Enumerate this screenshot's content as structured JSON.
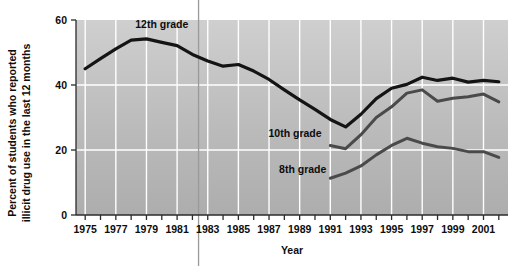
{
  "chart_data": {
    "type": "line",
    "title": "",
    "xlabel": "Year",
    "ylabel": "Percent of students who reported illicit drug use in the last 12 months",
    "ylabel_lines": [
      "Percent of students who reported",
      "illicit drug use in the last 12 months"
    ],
    "xlim": [
      1974.4,
      2002.6
    ],
    "ylim": [
      0,
      60
    ],
    "yticks": [
      0,
      20,
      40,
      60
    ],
    "ytick_labels": [
      "0",
      "20",
      "40",
      "60"
    ],
    "xticks": [
      1975,
      1976,
      1977,
      1978,
      1979,
      1980,
      1981,
      1982,
      1983,
      1984,
      1985,
      1986,
      1987,
      1988,
      1989,
      1990,
      1991,
      1992,
      1993,
      1994,
      1995,
      1996,
      1997,
      1998,
      1999,
      2000,
      2001,
      2002
    ],
    "xtick_labels": [
      "1975",
      "1977",
      "1979",
      "1981",
      "1983",
      "1985",
      "1987",
      "1989",
      "1991",
      "1993",
      "1995",
      "1997",
      "1999",
      "2001"
    ],
    "xtick_label_years": [
      1975,
      1977,
      1979,
      1981,
      1983,
      1985,
      1987,
      1989,
      1991,
      1993,
      1995,
      1997,
      1999,
      2001
    ],
    "gridlines": {
      "x_every_years": 2,
      "x_start": 1975,
      "y_values": [
        20,
        40
      ],
      "color": "#ffffff"
    },
    "plot_background": "#b4b4b4",
    "legend_position": "inline-annotations",
    "annotation_line": {
      "kind": "vertical-rule",
      "x_value": 1982.4,
      "color": "#9a9a9a"
    },
    "series": [
      {
        "name": "12th grade",
        "label": "12th grade",
        "color": "#141414",
        "width": 3.2,
        "label_point": {
          "x": 1980.0,
          "y": 57.5
        },
        "x": [
          1975,
          1976,
          1977,
          1978,
          1979,
          1980,
          1981,
          1982,
          1983,
          1984,
          1985,
          1986,
          1987,
          1988,
          1989,
          1990,
          1991,
          1992,
          1993,
          1994,
          1995,
          1996,
          1997,
          1998,
          1999,
          2000,
          2001,
          2002
        ],
        "values": [
          45.0,
          48.1,
          51.1,
          53.8,
          54.2,
          53.1,
          52.1,
          49.4,
          47.4,
          45.8,
          46.3,
          44.3,
          41.7,
          38.5,
          35.4,
          32.5,
          29.4,
          27.1,
          31.0,
          35.8,
          39.0,
          40.2,
          42.4,
          41.4,
          42.1,
          40.9,
          41.4,
          41.0
        ]
      },
      {
        "name": "10th grade",
        "label": "10th grade",
        "color": "#4a4a4a",
        "width": 3.0,
        "label_point": {
          "x": 1988.7,
          "y": 24.0
        },
        "x": [
          1991,
          1992,
          1993,
          1994,
          1995,
          1996,
          1997,
          1998,
          1999,
          2000,
          2001,
          2002
        ],
        "values": [
          21.4,
          20.4,
          24.7,
          30.0,
          33.3,
          37.5,
          38.5,
          35.0,
          35.9,
          36.4,
          37.2,
          34.8
        ]
      },
      {
        "name": "8th grade",
        "label": "8th grade",
        "color": "#4a4a4a",
        "width": 3.0,
        "label_point": {
          "x": 1989.2,
          "y": 13.0
        },
        "x": [
          1991,
          1992,
          1993,
          1994,
          1995,
          1996,
          1997,
          1998,
          1999,
          2000,
          2001,
          2002
        ],
        "values": [
          11.3,
          12.9,
          15.1,
          18.5,
          21.4,
          23.6,
          22.1,
          21.0,
          20.5,
          19.5,
          19.5,
          17.7
        ]
      }
    ]
  },
  "axes": {
    "y_title": "Percent of students who reported illicit drug use in the last 12 months",
    "x_title": "Year"
  }
}
